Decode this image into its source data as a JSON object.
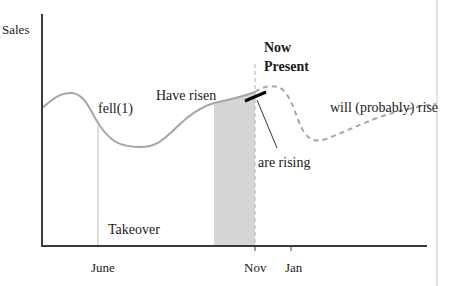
{
  "diagram": {
    "type": "timeline-sales-curve",
    "y_axis_label": "Sales",
    "x_ticks": [
      {
        "label": "June",
        "month_index": 0,
        "tick": false
      },
      {
        "label": "Nov",
        "month_index": 5,
        "tick": true
      },
      {
        "label": "Jan",
        "month_index": 7,
        "tick": true
      }
    ],
    "annotations": {
      "fell": "fell(1)",
      "have_risen": "Have risen",
      "now_line1": "Now",
      "now_line2": "Present",
      "are_rising": "are rising",
      "will_rise": "will (probably) rise",
      "takeover": "Takeover"
    },
    "segments": {
      "past": "solid",
      "future": "dashed"
    },
    "colors": {
      "curve": "#a6a6a6",
      "axis": "#3a3a3a",
      "shade": "#d6d6d6",
      "marker": "#000000",
      "text": "#1a1a1a"
    }
  }
}
